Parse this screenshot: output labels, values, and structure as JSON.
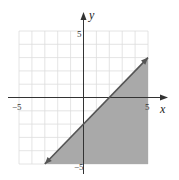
{
  "chart_data": {
    "type": "inequality-graph",
    "title": "",
    "xlabel": "x",
    "ylabel": "y",
    "xlim": [
      -5,
      5
    ],
    "ylim": [
      -5,
      5
    ],
    "grid": true,
    "grid_step": 1,
    "x_tick_labels": [
      {
        "value": -5,
        "label": "−5"
      },
      {
        "value": 5,
        "label": "5"
      }
    ],
    "y_tick_labels": [
      {
        "value": 5,
        "label": "5"
      },
      {
        "value": -5,
        "label": "−5"
      }
    ],
    "boundary_line": {
      "equation": "y = x - 2",
      "slope": 1,
      "intercept": -2,
      "style": "solid",
      "from": [
        -3,
        -5
      ],
      "to": [
        5,
        3
      ],
      "arrows": true
    },
    "shaded_region": "below",
    "inequality": "y ≤ x − 2",
    "colors": {
      "shade": "#a9a9a9",
      "grid": "#dddddd",
      "axis": "#333333",
      "line": "#555555"
    }
  },
  "labels": {
    "x_axis": "x",
    "y_axis": "y",
    "x_min": "−5",
    "x_max": "5",
    "y_max": "5",
    "y_min": "−5"
  }
}
